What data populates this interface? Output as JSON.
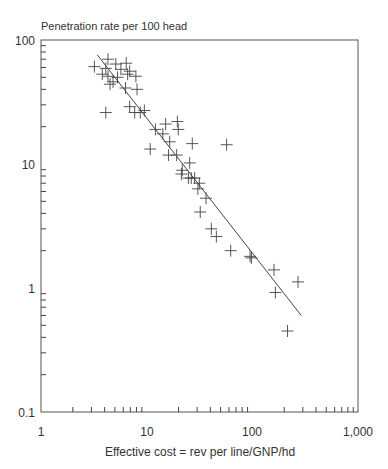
{
  "chart_data": {
    "type": "scatter",
    "title": "Penetration rate per 100 head",
    "xlabel": "Effective cost = rev per line/GNP/hd",
    "ylabel": "Penetration rate per 100 head",
    "xscale": "log",
    "yscale": "log",
    "xlim": [
      1,
      1000
    ],
    "ylim": [
      0.1,
      100
    ],
    "x_tick_labels": [
      "1",
      "10",
      "100",
      "1,000"
    ],
    "y_tick_labels": [
      "100",
      "10",
      "1",
      "0.1"
    ],
    "grid": false,
    "legend": null,
    "series": [
      {
        "name": "countries",
        "marker": "+",
        "points": [
          [
            3.2,
            61
          ],
          [
            4.3,
            70
          ],
          [
            4.1,
            59
          ],
          [
            4.3,
            51
          ],
          [
            4.8,
            46
          ],
          [
            4.5,
            44
          ],
          [
            5.1,
            64
          ],
          [
            5.7,
            58
          ],
          [
            6.4,
            65
          ],
          [
            6.6,
            53
          ],
          [
            6.9,
            56
          ],
          [
            7.9,
            51
          ],
          [
            6.3,
            41
          ],
          [
            8.1,
            40
          ],
          [
            4.1,
            26
          ],
          [
            6.9,
            29
          ],
          [
            7.7,
            26
          ],
          [
            8.7,
            26
          ],
          [
            5.3,
            50
          ],
          [
            3.8,
            53
          ],
          [
            9.5,
            27
          ],
          [
            12.1,
            19
          ],
          [
            15.1,
            21
          ],
          [
            19.5,
            22
          ],
          [
            19.9,
            19
          ],
          [
            14.2,
            17.5
          ],
          [
            16.5,
            15.1
          ],
          [
            10.8,
            13.2
          ],
          [
            16.1,
            11.8
          ],
          [
            19.2,
            11.8
          ],
          [
            25.5,
            10.2
          ],
          [
            21.7,
            8.9
          ],
          [
            21.3,
            8.3
          ],
          [
            27.0,
            14.6
          ],
          [
            24.8,
            7.7
          ],
          [
            26.4,
            7.7
          ],
          [
            28.4,
            7.7
          ],
          [
            31.5,
            7.0
          ],
          [
            30.5,
            6.3
          ],
          [
            36.4,
            5.3
          ],
          [
            32.1,
            4.1
          ],
          [
            40.9,
            3.0
          ],
          [
            45.6,
            2.6
          ],
          [
            57.0,
            14.3
          ],
          [
            62.3,
            2.0
          ],
          [
            95,
            1.8
          ],
          [
            98,
            1.75
          ],
          [
            160,
            1.4
          ],
          [
            165,
            0.92
          ],
          [
            270,
            1.12
          ],
          [
            215,
            0.45
          ]
        ]
      },
      {
        "name": "fit",
        "type": "line",
        "points": [
          [
            3.4,
            76
          ],
          [
            290,
            0.6
          ]
        ]
      }
    ]
  }
}
